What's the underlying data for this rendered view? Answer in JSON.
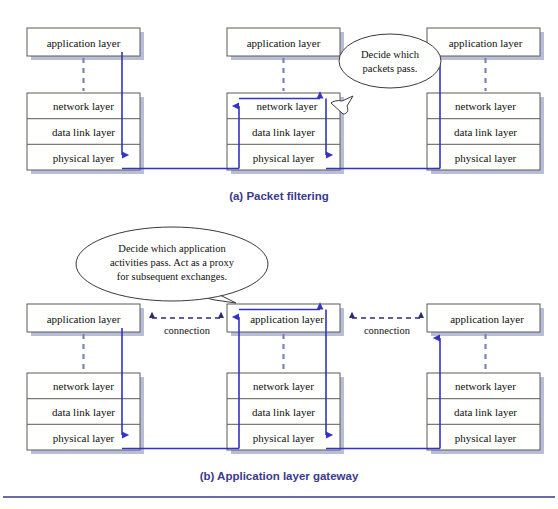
{
  "figure": {
    "background_color": "#ffffff",
    "accent_color": "#3b3a8c",
    "flow_color": "#3333c4",
    "connection_color": "#2b2b78",
    "dashed_connector_color": "#7b84b8",
    "box_border_color": "#5a5a58",
    "box_shadow_color": "#b9bed8"
  },
  "layers": {
    "application": "application layer",
    "network": "network layer",
    "data_link": "data link layer",
    "physical": "physical layer"
  },
  "panel_a": {
    "caption": "(a) Packet filtering",
    "callout": {
      "line1": "Decide which",
      "line2": "packets pass."
    },
    "hosts": [
      {
        "name": "left-host",
        "application": "application layer",
        "network": "network layer",
        "data_link": "data link layer",
        "physical": "physical layer"
      },
      {
        "name": "middle-router",
        "application": "application layer",
        "network": "network layer",
        "data_link": "data link layer",
        "physical": "physical layer"
      },
      {
        "name": "right-host",
        "application": "application layer",
        "network": "network layer",
        "data_link": "data link layer",
        "physical": "physical layer"
      }
    ]
  },
  "panel_b": {
    "caption": "(b) Application layer gateway",
    "callout": {
      "line1": "Decide which application",
      "line2": "activities pass. Act as a proxy",
      "line3": "for subsequent exchanges."
    },
    "connection_label_left": "connection",
    "connection_label_right": "connection",
    "hosts": [
      {
        "name": "left-host",
        "application": "application layer",
        "network": "network layer",
        "data_link": "data link layer",
        "physical": "physical layer"
      },
      {
        "name": "middle-gateway",
        "application": "application layer",
        "network": "network layer",
        "data_link": "data link layer",
        "physical": "physical layer"
      },
      {
        "name": "right-host",
        "application": "application layer",
        "network": "network layer",
        "data_link": "data link layer",
        "physical": "physical layer"
      }
    ]
  }
}
